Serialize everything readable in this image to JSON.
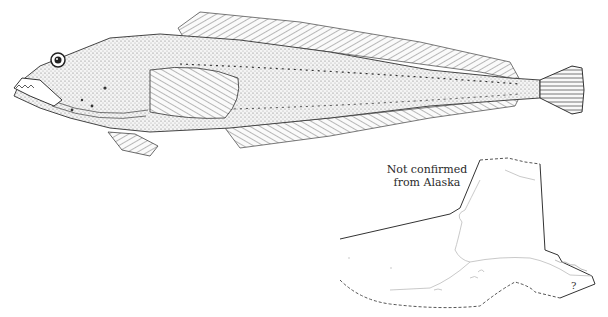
{
  "figure": {
    "map_note_line1": "Not confirmed",
    "map_note_line2": "from Alaska",
    "map_uncertain_marker": "?"
  }
}
